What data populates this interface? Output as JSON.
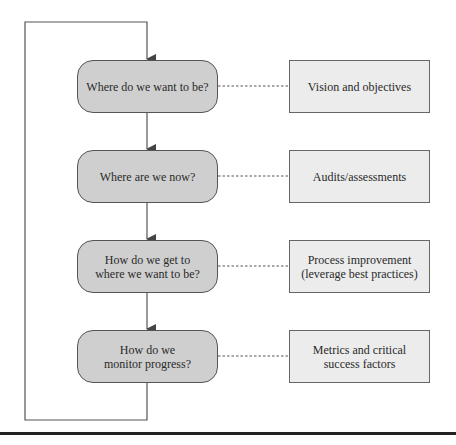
{
  "diagram": {
    "steps": [
      {
        "label": "Where do we want to be?",
        "note": "Vision and objectives"
      },
      {
        "label": "Where are we now?",
        "note": "Audits/assessments"
      },
      {
        "label": "How do we get to where we want to be?",
        "note": "Process improvement (leverage best practices)"
      },
      {
        "label": "How do we monitor progress?",
        "note": "Metrics and critical success factors"
      }
    ],
    "colors": {
      "step_fill": "#cfcfcf",
      "note_fill": "#ececec",
      "line": "#555555"
    }
  }
}
